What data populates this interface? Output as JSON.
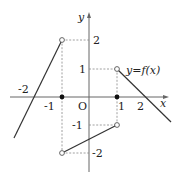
{
  "figure": {
    "function_label": "y=f(x)",
    "axis_labels": {
      "x": "x",
      "y": "y",
      "origin": "O"
    },
    "x_ticks": [
      "-2",
      "-1",
      "1",
      "2"
    ],
    "y_ticks": [
      "2",
      "1",
      "-1",
      "-2"
    ],
    "segments": [
      {
        "from": [
          -2.8,
          -1.4
        ],
        "to": [
          -1,
          2
        ],
        "from_open": false,
        "to_open": true,
        "description": "line through (-2,0) up to open point (-1,2)"
      },
      {
        "from": [
          -1,
          -2
        ],
        "to": [
          1,
          -1
        ],
        "from_open": true,
        "to_open": true,
        "description": "segment from open (-1,-2) to open (1,-1)"
      },
      {
        "from": [
          1,
          1
        ],
        "to": [
          3,
          -0.9
        ],
        "from_open": true,
        "to_open": false,
        "description": "line from open (1,1) through (2,0)"
      }
    ],
    "isolated_points": [
      {
        "x": -1,
        "y": 0,
        "filled": true
      },
      {
        "x": 1,
        "y": 0,
        "filled": true
      }
    ],
    "colors": {
      "axis": "#666666",
      "curve": "#333333",
      "dash": "#888888"
    }
  }
}
